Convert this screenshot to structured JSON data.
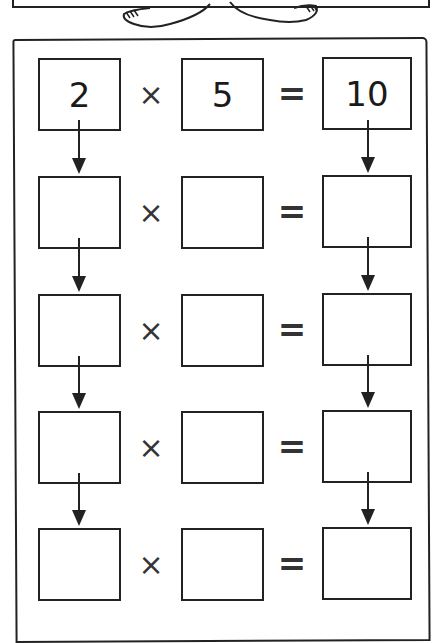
{
  "worksheet": {
    "operators": {
      "times": "×",
      "equals": "="
    },
    "rows": [
      {
        "a": "2",
        "b": "5",
        "result": "10"
      },
      {
        "a": "",
        "b": "",
        "result": ""
      },
      {
        "a": "",
        "b": "",
        "result": ""
      },
      {
        "a": "",
        "b": "",
        "result": ""
      },
      {
        "a": "",
        "b": "",
        "result": ""
      }
    ]
  }
}
